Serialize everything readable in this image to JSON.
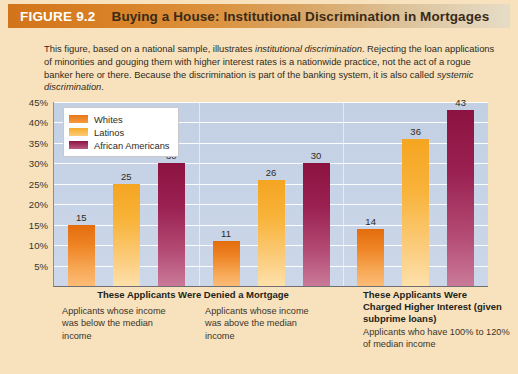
{
  "header": {
    "figure_number": "FIGURE 9.2",
    "title": "Buying a House: Institutional Discrimination in Mortgages"
  },
  "intro": {
    "part1": "This figure, based on a national sample, illustrates ",
    "em1": "institutional discrimination",
    "part2": ". Rejecting the loan applications of minorities and gouging them with higher interest rates is a nationwide practice, not the act of a rogue banker here or there. Because the discrimination is part of the banking system, it is also called ",
    "em2": "systemic discrimination",
    "part3": "."
  },
  "captions": {
    "denied_heading": "These Applicants Were Denied a Mortgage",
    "below_median": "Applicants whose income was below the median income",
    "above_median": "Applicants whose income was above the median income",
    "charged_heading": "These Applicants Were Charged Higher Interest (given subprime loans)",
    "charged_body": "Applicants who have 100% to 120% of median income"
  },
  "chart_data": {
    "type": "bar",
    "title": "Buying a House: Institutional Discrimination in Mortgages",
    "xlabel": "",
    "ylabel": "",
    "ylim": [
      0,
      45
    ],
    "ytick_labels": [
      "45%",
      "40%",
      "35%",
      "30%",
      "25%",
      "20%",
      "15%",
      "10%",
      "5%"
    ],
    "ytick_values": [
      45,
      40,
      35,
      30,
      25,
      20,
      15,
      10,
      5
    ],
    "grid": true,
    "legend_position": "top-left",
    "categories": [
      "Applicants whose income was below the median income",
      "Applicants whose income was above the median income",
      "Applicants who have 100% to 120% of median income"
    ],
    "series": [
      {
        "name": "Whites",
        "color": "#ee8426",
        "values": [
          15,
          11,
          14
        ]
      },
      {
        "name": "Latinos",
        "color": "#f8b339",
        "values": [
          25,
          26,
          36
        ]
      },
      {
        "name": "African Americans",
        "color": "#992050",
        "values": [
          30,
          30,
          43
        ]
      }
    ]
  },
  "colors": {
    "figure_background": "#f7e2bd",
    "plot_background": "#c7d3e6",
    "title_bar_start": "#d2741a",
    "title_bar_end": "#e6dcc6",
    "whites": "#ee8426",
    "latinos": "#f8b339",
    "african_americans": "#992050"
  }
}
